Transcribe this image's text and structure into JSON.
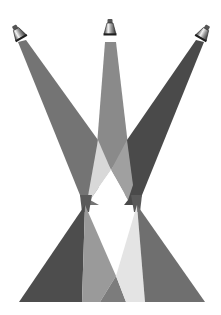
{
  "figure": {
    "background": "#ffffff",
    "lamps": [
      {
        "name": "left-spotlight",
        "x": 20,
        "y": 35,
        "angle": -30
      },
      {
        "name": "center-spotlight",
        "x": 110,
        "y": 30,
        "angle": 0
      },
      {
        "name": "right-spotlight",
        "x": 202,
        "y": 35,
        "angle": 30
      }
    ],
    "colors": {
      "left_beam_upper": "#747474",
      "center_beam_upper": "#8a8a8a",
      "right_beam_upper": "#4a4a4a",
      "left_beam_lower": "#4d4d4d",
      "right_beam_lower": "#6f6f6f",
      "overlap_light": "#d8d8d8",
      "overlap_mid": "#a0a0a0",
      "overlap_lower_left": "#9a9a9a",
      "overlap_lower_center": "#7c7c7c",
      "overlap_lower_right": "#e4e4e4"
    }
  }
}
